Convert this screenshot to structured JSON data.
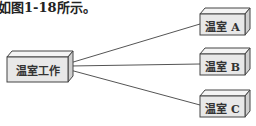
{
  "caption": "如图1-18所示。",
  "diagram": {
    "root": {
      "label": "温室工作"
    },
    "children": [
      {
        "label": "温室 A"
      },
      {
        "label": "温室 B"
      },
      {
        "label": "温室 C"
      }
    ],
    "colors": {
      "box_front": "#e8e8e8",
      "box_top": "#f4f4f4",
      "box_side": "#cfcfcf",
      "stroke": "#444444",
      "line": "#555555"
    }
  }
}
